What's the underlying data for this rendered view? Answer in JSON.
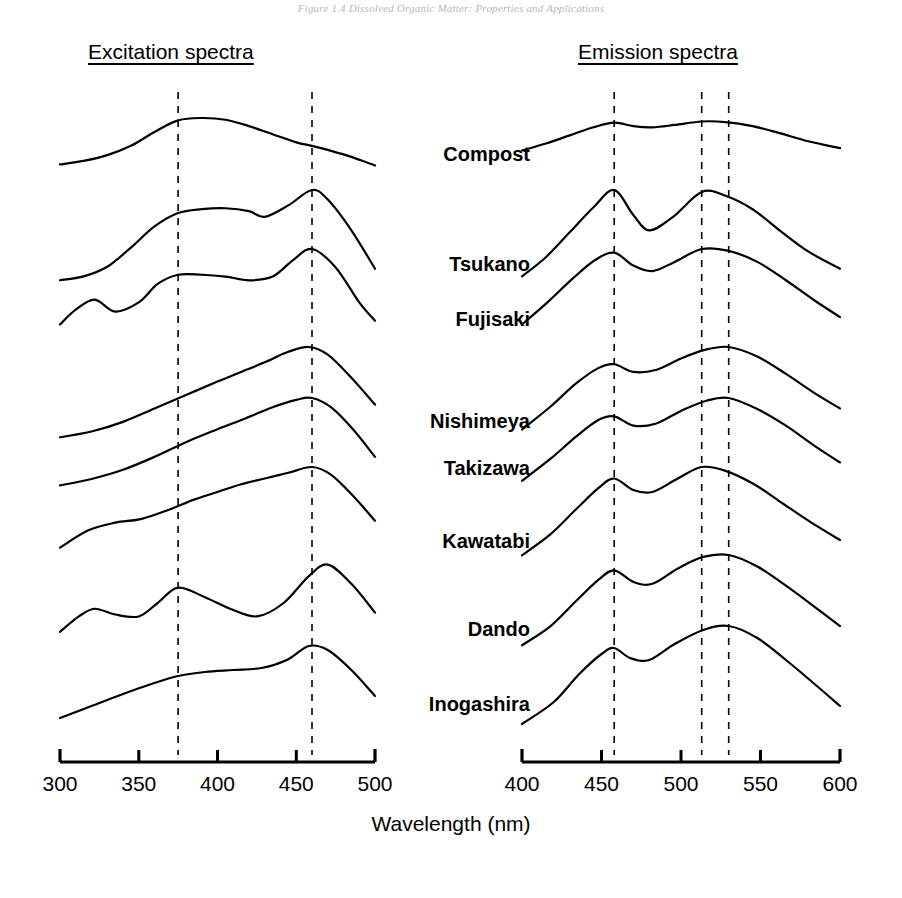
{
  "page_header": "Figure 1.4  Dissolved Organic Matter: Properties and Applications",
  "panels": {
    "excitation": {
      "title": "Excitation spectra"
    },
    "emission": {
      "title": "Emission spectra"
    }
  },
  "axis": {
    "title": "Wavelength (nm)"
  },
  "samples": [
    {
      "name": "Compost"
    },
    {
      "name": "Tsukano"
    },
    {
      "name": "Fujisaki"
    },
    {
      "name": "Nishimeya"
    },
    {
      "name": "Takizawa"
    },
    {
      "name": "Kawatabi"
    },
    {
      "name": "Dando"
    },
    {
      "name": "Inogashira"
    }
  ],
  "chart_data": {
    "type": "line",
    "xlabel": "Wavelength (nm)",
    "ylabel": "",
    "grid": false,
    "legend": "none",
    "stacked_offset": true,
    "line_color": "#000000",
    "panels": [
      {
        "id": "excitation",
        "title": "Excitation spectra",
        "xlim": [
          300,
          500
        ],
        "xticks": [
          300,
          350,
          400,
          450,
          500
        ],
        "xticklabels": [
          "300",
          "350",
          "400",
          "450",
          "500"
        ],
        "minor_ticks": [
          325,
          375,
          425,
          475
        ],
        "reference_lines": [
          375,
          460
        ],
        "series": [
          {
            "name": "Compost",
            "x": [
              300,
              315,
              330,
              345,
              360,
              375,
              390,
              405,
              420,
              435,
              450,
              460,
              470,
              485,
              500
            ],
            "values": [
              0.2,
              0.26,
              0.36,
              0.52,
              0.76,
              0.96,
              1.0,
              0.97,
              0.86,
              0.72,
              0.58,
              0.52,
              0.45,
              0.33,
              0.18
            ]
          },
          {
            "name": "Tsukano",
            "x": [
              300,
              315,
              330,
              345,
              360,
              375,
              390,
              405,
              420,
              430,
              445,
              460,
              470,
              485,
              500
            ],
            "values": [
              0.06,
              0.1,
              0.2,
              0.4,
              0.62,
              0.76,
              0.8,
              0.81,
              0.78,
              0.72,
              0.84,
              1.0,
              0.9,
              0.58,
              0.18
            ]
          },
          {
            "name": "Fujisaki",
            "x": [
              300,
              310,
              322,
              335,
              350,
              362,
              375,
              390,
              405,
              420,
              435,
              448,
              460,
              475,
              490,
              500
            ],
            "values": [
              0.18,
              0.34,
              0.45,
              0.32,
              0.42,
              0.62,
              0.72,
              0.72,
              0.7,
              0.66,
              0.7,
              0.88,
              1.0,
              0.8,
              0.42,
              0.22
            ]
          },
          {
            "name": "Nishimeya",
            "x": [
              300,
              320,
              340,
              360,
              380,
              400,
              415,
              430,
              445,
              458,
              470,
              485,
              500
            ],
            "values": [
              0.06,
              0.12,
              0.22,
              0.36,
              0.5,
              0.64,
              0.74,
              0.84,
              0.95,
              1.0,
              0.92,
              0.68,
              0.4
            ]
          },
          {
            "name": "Takizawa",
            "x": [
              300,
              320,
              340,
              360,
              380,
              400,
              418,
              435,
              450,
              460,
              472,
              486,
              500
            ],
            "values": [
              0.05,
              0.12,
              0.22,
              0.36,
              0.52,
              0.66,
              0.78,
              0.9,
              0.98,
              1.0,
              0.9,
              0.66,
              0.36
            ]
          },
          {
            "name": "Kawatabi",
            "x": [
              300,
              318,
              335,
              352,
              370,
              385,
              400,
              415,
              430,
              445,
              460,
              472,
              486,
              500
            ],
            "values": [
              0.16,
              0.34,
              0.42,
              0.46,
              0.56,
              0.66,
              0.74,
              0.82,
              0.88,
              0.94,
              1.0,
              0.92,
              0.7,
              0.44
            ]
          },
          {
            "name": "Dando",
            "x": [
              300,
              312,
              322,
              335,
              350,
              362,
              375,
              392,
              408,
              425,
              442,
              458,
              470,
              485,
              500
            ],
            "values": [
              0.2,
              0.36,
              0.44,
              0.38,
              0.36,
              0.5,
              0.66,
              0.56,
              0.44,
              0.36,
              0.5,
              0.78,
              0.9,
              0.7,
              0.4
            ]
          },
          {
            "name": "Inogashira",
            "x": [
              300,
              320,
              340,
              358,
              375,
              392,
              410,
              428,
              444,
              458,
              470,
              485,
              500
            ],
            "values": [
              0.08,
              0.2,
              0.32,
              0.42,
              0.5,
              0.54,
              0.56,
              0.58,
              0.66,
              0.8,
              0.76,
              0.56,
              0.3
            ]
          }
        ]
      },
      {
        "id": "emission",
        "title": "Emission spectra",
        "xlim": [
          400,
          600
        ],
        "xticks": [
          400,
          450,
          500,
          550,
          600
        ],
        "xticklabels": [
          "400",
          "450",
          "500",
          "550",
          "600"
        ],
        "minor_ticks": [
          425,
          475,
          525,
          575
        ],
        "reference_lines": [
          458,
          513,
          530
        ],
        "series": [
          {
            "name": "Compost",
            "x": [
              400,
              415,
              430,
              445,
              458,
              470,
              482,
              496,
              513,
              528,
              545,
              562,
              580,
              600
            ],
            "values": [
              0.44,
              0.56,
              0.7,
              0.84,
              0.92,
              0.86,
              0.84,
              0.88,
              0.94,
              0.93,
              0.86,
              0.74,
              0.6,
              0.48
            ]
          },
          {
            "name": "Tsukano",
            "x": [
              400,
              415,
              430,
              445,
              458,
              470,
              480,
              495,
              513,
              528,
              545,
              562,
              580,
              600
            ],
            "values": [
              0.1,
              0.3,
              0.56,
              0.82,
              1.0,
              0.74,
              0.58,
              0.72,
              0.98,
              0.94,
              0.8,
              0.58,
              0.36,
              0.18
            ]
          },
          {
            "name": "Fujisaki",
            "x": [
              400,
              416,
              432,
              446,
              458,
              470,
              482,
              496,
              513,
              530,
              548,
              566,
              584,
              600
            ],
            "values": [
              0.18,
              0.42,
              0.68,
              0.88,
              0.96,
              0.82,
              0.76,
              0.86,
              1.0,
              0.98,
              0.86,
              0.66,
              0.44,
              0.26
            ]
          },
          {
            "name": "Nishimeya",
            "x": [
              400,
              418,
              434,
              448,
              458,
              470,
              484,
              500,
              515,
              530,
              548,
              566,
              584,
              600
            ],
            "values": [
              0.14,
              0.38,
              0.62,
              0.78,
              0.82,
              0.74,
              0.76,
              0.88,
              0.97,
              1.0,
              0.9,
              0.72,
              0.52,
              0.36
            ]
          },
          {
            "name": "Takizawa",
            "x": [
              400,
              418,
              434,
              448,
              458,
              470,
              484,
              500,
              516,
              530,
              548,
              566,
              584,
              600
            ],
            "values": [
              0.1,
              0.34,
              0.58,
              0.76,
              0.8,
              0.7,
              0.72,
              0.86,
              0.97,
              1.0,
              0.88,
              0.7,
              0.48,
              0.3
            ]
          },
          {
            "name": "Kawatabi",
            "x": [
              400,
              418,
              434,
              448,
              458,
              470,
              482,
              498,
              513,
              528,
              546,
              564,
              582,
              600
            ],
            "values": [
              0.08,
              0.3,
              0.56,
              0.78,
              0.88,
              0.76,
              0.74,
              0.88,
              1.0,
              0.96,
              0.82,
              0.62,
              0.42,
              0.24
            ]
          },
          {
            "name": "Dando",
            "x": [
              400,
              418,
              434,
              448,
              458,
              470,
              482,
              498,
              514,
              530,
              548,
              566,
              584,
              600
            ],
            "values": [
              0.06,
              0.26,
              0.52,
              0.74,
              0.84,
              0.72,
              0.7,
              0.86,
              0.98,
              1.0,
              0.88,
              0.68,
              0.46,
              0.26
            ]
          },
          {
            "name": "Inogashira",
            "x": [
              400,
              420,
              436,
              450,
              458,
              468,
              480,
              496,
              514,
              530,
              548,
              566,
              584,
              600
            ],
            "values": [
              0.02,
              0.24,
              0.52,
              0.72,
              0.78,
              0.68,
              0.66,
              0.82,
              0.96,
              1.0,
              0.88,
              0.66,
              0.42,
              0.2
            ]
          }
        ]
      }
    ]
  }
}
